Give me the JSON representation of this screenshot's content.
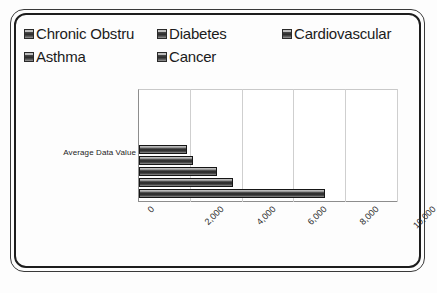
{
  "legend": {
    "items": [
      {
        "label": "Chronic Obstru",
        "marker": "square-swatch-icon"
      },
      {
        "label": "Diabetes",
        "marker": "square-swatch-icon"
      },
      {
        "label": "Cardiovascular",
        "marker": "square-swatch-icon"
      },
      {
        "label": "Asthma",
        "marker": "square-swatch-icon"
      },
      {
        "label": "Cancer",
        "marker": "square-swatch-icon"
      }
    ]
  },
  "axis": {
    "category_label": "Average Data Value",
    "ticks": [
      "0",
      "2,000",
      "4,000",
      "6,000",
      "8,000",
      "10,000"
    ]
  },
  "colors": {
    "frame": "#1d1d1d",
    "bar_dark": "#262626",
    "bar_light": "#d8d8d8",
    "gridline": "#cfcfcf",
    "background": "#ffffff"
  },
  "chart_data": {
    "type": "bar",
    "orientation": "horizontal",
    "title": "",
    "xlabel": "",
    "ylabel": "Average Data Value",
    "categories": [
      "Average Data Value"
    ],
    "series": [
      {
        "name": "Chronic Obstru",
        "values": [
          1850
        ]
      },
      {
        "name": "Diabetes",
        "values": [
          2080
        ]
      },
      {
        "name": "Cardiovascular",
        "values": [
          3000
        ]
      },
      {
        "name": "Asthma",
        "values": [
          3620
        ]
      },
      {
        "name": "Cancer",
        "values": [
          7200
        ]
      }
    ],
    "xlim": [
      0,
      10000
    ],
    "xticks": [
      0,
      2000,
      4000,
      6000,
      8000,
      10000
    ],
    "xtick_labels": [
      "0",
      "2,000",
      "4,000",
      "6,000",
      "8,000",
      "10,000"
    ],
    "xtick_rotation": -45,
    "grid": true,
    "legend_position": "top"
  }
}
